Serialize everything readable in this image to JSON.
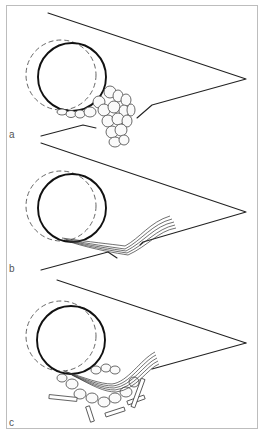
{
  "figure": {
    "panels": [
      {
        "label": "a",
        "description": "round structure with clustered globules beneath wedge"
      },
      {
        "label": "b",
        "description": "round structure with layered fibers beneath wedge"
      },
      {
        "label": "c",
        "description": "round structure with layered fibers, globules and scattered debris beneath wedge"
      }
    ]
  },
  "colors": {
    "ink": "#222222",
    "border": "#bdbdbd",
    "background": "#ffffff",
    "label": "#555555"
  }
}
